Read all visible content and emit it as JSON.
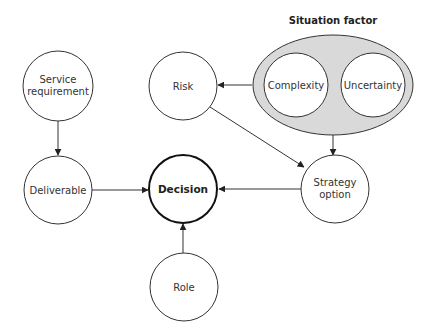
{
  "diagram": {
    "colors": {
      "stroke": "#333333",
      "group_fill": "#d9d9d9",
      "node_fill": "#ffffff",
      "background": "#ffffff"
    },
    "group": {
      "title": "Situation factor",
      "children": [
        "Complexity",
        "Uncertainty"
      ]
    },
    "nodes": {
      "service_requirement": {
        "line1": "Service",
        "line2": "requirement"
      },
      "risk": {
        "label": "Risk"
      },
      "complexity": {
        "label": "Complexity"
      },
      "uncertainty": {
        "label": "Uncertainty"
      },
      "deliverable": {
        "label": "Deliverable"
      },
      "decision": {
        "label": "Decision"
      },
      "strategy_option": {
        "line1": "Strategy",
        "line2": "option"
      },
      "role": {
        "label": "Role"
      }
    },
    "edges": [
      {
        "from": "Service requirement",
        "to": "Deliverable"
      },
      {
        "from": "Deliverable",
        "to": "Decision"
      },
      {
        "from": "Strategy option",
        "to": "Decision"
      },
      {
        "from": "Role",
        "to": "Decision"
      },
      {
        "from": "Situation factor",
        "to": "Risk"
      },
      {
        "from": "Situation factor",
        "to": "Strategy option"
      },
      {
        "from": "Risk",
        "to": "Strategy option"
      }
    ]
  }
}
